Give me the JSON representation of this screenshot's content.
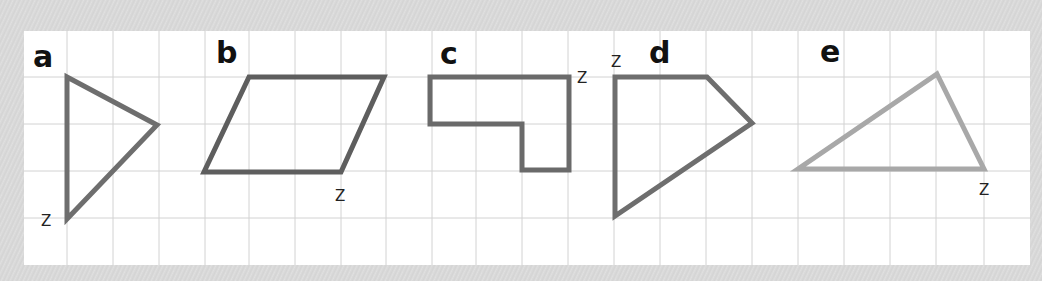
{
  "worksheet": {
    "paper": {
      "x": 24,
      "y": 31,
      "width": 1006,
      "height": 234,
      "color": "#ffffff"
    },
    "grid": {
      "color": "#d2d2d2",
      "vertical_lines": [
        67,
        113,
        159,
        205,
        249,
        295,
        341,
        386,
        432,
        476,
        522,
        568,
        614,
        660,
        706,
        752,
        798,
        844,
        890,
        936,
        984
      ],
      "horizontal_lines": [
        77,
        124,
        171,
        218
      ]
    },
    "shapes": [
      {
        "id": "a",
        "label": "a",
        "label_pos": [
          33,
          67
        ],
        "vertex_label": "Z",
        "vertex_label_pos": [
          41,
          226
        ],
        "stroke": "#6e6e6e",
        "points": "67,77 157,125 67,219"
      },
      {
        "id": "b",
        "label": "b",
        "label_pos": [
          216,
          63
        ],
        "vertex_label": "Z",
        "vertex_label_pos": [
          335,
          201
        ],
        "stroke": "#5e5e5e",
        "points": "249,77 384,77 341,172 204,172"
      },
      {
        "id": "c",
        "label": "c",
        "label_pos": [
          440,
          64
        ],
        "vertex_label": "Z",
        "vertex_label_pos": [
          577,
          83
        ],
        "stroke": "#6a6a6a",
        "points": "430,77 569,77 569,170 522,170 522,124 430,124"
      },
      {
        "id": "d",
        "label": "d",
        "label_pos": [
          649,
          63
        ],
        "vertex_label": "Z",
        "vertex_label_pos": [
          611,
          67
        ],
        "stroke": "#6e6e6e",
        "points": "615,77 707,77 752,123 615,216"
      },
      {
        "id": "e",
        "label": "e",
        "label_pos": [
          820,
          62
        ],
        "vertex_label": "Z",
        "vertex_label_pos": [
          979,
          195
        ],
        "stroke": "#a8a8a8",
        "points": "937,74 984,169 798,169"
      }
    ]
  }
}
